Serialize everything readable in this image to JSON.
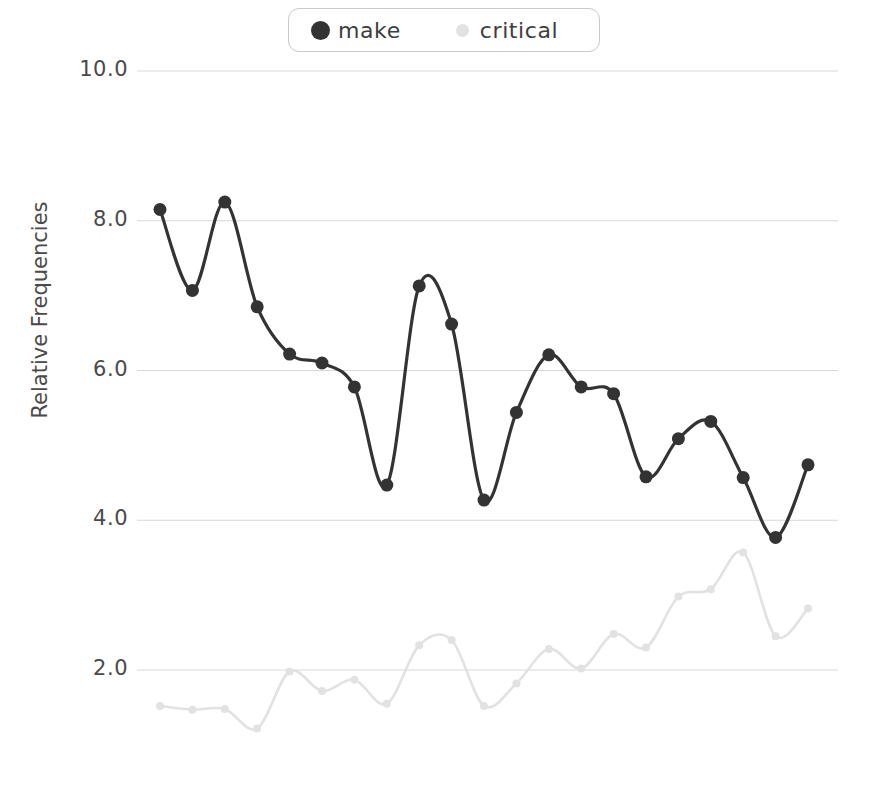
{
  "chart_data": {
    "type": "line",
    "title": "",
    "xlabel": "",
    "ylabel": "Relative Frequencies",
    "ylim": [
      1.0,
      10.4
    ],
    "yticks": [
      10.0,
      8.0,
      6.0,
      4.0,
      2.0
    ],
    "ytick_labels": [
      "10.0",
      "8.0",
      "6.0",
      "4.0",
      "2.0"
    ],
    "grid": true,
    "xaxis_visible": false,
    "legend_position": "top-center",
    "x": [
      1,
      2,
      3,
      4,
      5,
      6,
      7,
      8,
      9,
      10,
      11,
      12,
      13,
      14,
      15,
      16,
      17,
      18,
      19,
      20,
      21
    ],
    "series": [
      {
        "name": "make",
        "color": "#333333",
        "marker": "circle",
        "marker_size": 13,
        "values": [
          8.15,
          7.07,
          8.25,
          6.85,
          6.22,
          6.1,
          5.78,
          4.47,
          7.13,
          6.62,
          4.27,
          5.44,
          6.21,
          5.78,
          5.69,
          4.58,
          5.09,
          5.32,
          4.57,
          3.77,
          4.74
        ]
      },
      {
        "name": "critical",
        "color": "#e2e2e2",
        "marker": "circle",
        "marker_size": 8,
        "values": [
          1.52,
          1.47,
          1.48,
          1.22,
          1.98,
          1.72,
          1.87,
          1.55,
          2.33,
          2.4,
          1.52,
          1.82,
          2.28,
          2.02,
          2.48,
          2.3,
          2.98,
          3.08,
          3.57,
          2.45,
          2.82
        ]
      }
    ]
  },
  "legend": {
    "items": [
      {
        "label": "make",
        "color": "#333333"
      },
      {
        "label": "critical",
        "color": "#e2e2e2"
      }
    ]
  },
  "axis": {
    "y_title": "Relative Frequencies"
  },
  "colors": {
    "background": "#ffffff",
    "grid": "#d8d8d8",
    "tick_text": "#4a4a4a",
    "legend_border": "#c9c9c9",
    "make": "#333333",
    "critical": "#e2e2e2"
  }
}
